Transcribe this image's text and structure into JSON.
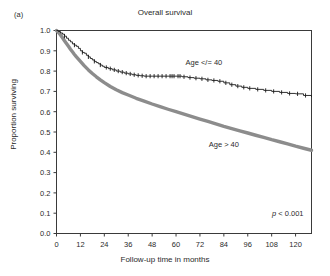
{
  "figure": {
    "panel_label": "(a)",
    "title": "Overall survival"
  },
  "axes": {
    "x_title": "Follow-up time in months",
    "y_title": "Proportion surviving",
    "x_ticks": [
      "0",
      "12",
      "24",
      "36",
      "48",
      "60",
      "72",
      "84",
      "96",
      "108",
      "120"
    ],
    "y_ticks": [
      "0.0",
      "0.1",
      "0.2",
      "0.3",
      "0.4",
      "0.5",
      "0.6",
      "0.7",
      "0.8",
      "0.9",
      "1.0"
    ]
  },
  "annotations": {
    "series_upper_label": "Age </= 40",
    "series_lower_label": "Age > 40",
    "pvalue_italic": "p",
    "pvalue_rest": " < 0.001"
  },
  "colors": {
    "upper_curve": "#1a1a1a",
    "lower_curve": "#8c8c8c",
    "axis": "#3a3a3a",
    "text": "#2b2b2b",
    "background": "#ffffff"
  },
  "chart_data": {
    "type": "line",
    "title": "Overall survival",
    "xlabel": "Follow-up time in months",
    "ylabel": "Proportion surviving",
    "xlim": [
      0,
      128
    ],
    "ylim": [
      0.0,
      1.0
    ],
    "grid": false,
    "legend": "inline-annotations",
    "annotations": [
      "Age </= 40",
      "Age > 40",
      "p < 0.001"
    ],
    "series": [
      {
        "name": "Age </= 40",
        "style": "stepped-thin-black-with-censor-marks",
        "color": "#1a1a1a",
        "x": [
          0,
          1,
          2,
          3,
          4,
          5,
          6,
          7,
          8,
          9,
          10,
          11,
          12,
          13,
          14,
          15,
          16,
          17,
          18,
          19,
          20,
          21,
          22,
          23,
          24,
          26,
          28,
          30,
          32,
          34,
          36,
          38,
          40,
          42,
          44,
          46,
          48,
          52,
          56,
          60,
          63,
          66,
          69,
          72,
          75,
          78,
          81,
          84,
          87,
          90,
          93,
          96,
          100,
          104,
          108,
          112,
          116,
          120,
          124,
          128
        ],
        "y": [
          1.0,
          0.995,
          0.988,
          0.982,
          0.972,
          0.962,
          0.952,
          0.944,
          0.934,
          0.928,
          0.922,
          0.912,
          0.9,
          0.892,
          0.888,
          0.878,
          0.87,
          0.862,
          0.855,
          0.848,
          0.842,
          0.836,
          0.83,
          0.824,
          0.818,
          0.812,
          0.806,
          0.8,
          0.795,
          0.79,
          0.786,
          0.782,
          0.779,
          0.777,
          0.775,
          0.775,
          0.775,
          0.775,
          0.775,
          0.775,
          0.772,
          0.768,
          0.765,
          0.762,
          0.757,
          0.754,
          0.75,
          0.742,
          0.733,
          0.726,
          0.72,
          0.715,
          0.71,
          0.705,
          0.7,
          0.695,
          0.69,
          0.688,
          0.68,
          0.672
        ],
        "censor_x": [
          4,
          9,
          13,
          16,
          19,
          22,
          25,
          27,
          29,
          31,
          33,
          35,
          37,
          39,
          41,
          43,
          45,
          47,
          49,
          51,
          53,
          55,
          57,
          58,
          59,
          61,
          62,
          64,
          67,
          70,
          73,
          76,
          79,
          82,
          85,
          88,
          91,
          94,
          97,
          101,
          105,
          109,
          113,
          117,
          121,
          125
        ]
      },
      {
        "name": "Age > 40",
        "style": "thick-gray-line",
        "color": "#8c8c8c",
        "x": [
          0,
          1,
          2,
          3,
          4,
          5,
          6,
          7,
          8,
          9,
          10,
          12,
          14,
          16,
          18,
          20,
          22,
          24,
          27,
          30,
          33,
          36,
          40,
          44,
          48,
          52,
          56,
          60,
          64,
          68,
          72,
          76,
          80,
          84,
          88,
          92,
          96,
          100,
          104,
          108,
          112,
          116,
          120,
          124,
          128
        ],
        "y": [
          1.0,
          0.99,
          0.978,
          0.964,
          0.95,
          0.936,
          0.922,
          0.908,
          0.895,
          0.882,
          0.87,
          0.848,
          0.826,
          0.806,
          0.788,
          0.772,
          0.757,
          0.743,
          0.724,
          0.708,
          0.694,
          0.682,
          0.666,
          0.652,
          0.638,
          0.625,
          0.612,
          0.6,
          0.588,
          0.576,
          0.564,
          0.552,
          0.54,
          0.528,
          0.517,
          0.506,
          0.495,
          0.484,
          0.473,
          0.462,
          0.452,
          0.441,
          0.43,
          0.42,
          0.41
        ]
      }
    ]
  }
}
